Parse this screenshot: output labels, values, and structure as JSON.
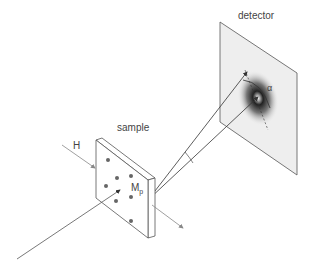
{
  "labels": {
    "detector": "detector",
    "sample": "sample",
    "field": "H",
    "magnetization": "M",
    "magnetization_sub": "p",
    "angle": "α"
  },
  "colors": {
    "line": "#555555",
    "arrow_gray": "#888888",
    "detector_fill": "#eeeeee",
    "scatter_dark": "#333333"
  }
}
